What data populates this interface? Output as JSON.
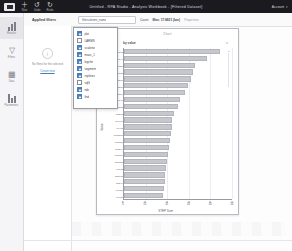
{
  "topbar": {
    "logo_icon": "app-logo-icon",
    "buttons": [
      {
        "icon": "plus-icon",
        "glyph": "＋",
        "label": "New"
      },
      {
        "icon": "undo-icon",
        "glyph": "↺",
        "label": "Undo"
      },
      {
        "icon": "redo-icon",
        "glyph": "↻",
        "label": "Redo"
      }
    ],
    "title": "Untitled - RPA Studio - Analysis Workbook - [Filtered Dataset]",
    "account_label": "Account",
    "chevron": "▾"
  },
  "rail": {
    "items": [
      {
        "label": "Results",
        "icon": "bar-chart-icon",
        "active": true
      },
      {
        "label": "Filters",
        "icon": "funnel-icon",
        "active": false
      },
      {
        "label": "Data",
        "icon": "table-icon",
        "active": false
      },
      {
        "label": "Parameters",
        "icon": "sliders-icon",
        "active": false
      }
    ]
  },
  "subbar": {
    "title": "Applied filters",
    "search_value": "filtercolumn_name",
    "chips": [
      {
        "text": "Count",
        "muted": false,
        "bold": false
      },
      {
        "text": "Max: 17.8821 (bar)",
        "muted": false,
        "bold": true
      },
      {
        "text": "Properties",
        "muted": true,
        "bold": false
      }
    ]
  },
  "filters_pane": {
    "circle_icon": "info-icon",
    "glyph": "i",
    "message": "No filters for the selected",
    "link": "Create new"
  },
  "dropdown": {
    "name": "column-multiselect-dropdown",
    "items": [
      {
        "label": "plot",
        "checked": true
      },
      {
        "label": "LARMS",
        "checked": false
      },
      {
        "label": "scaleno",
        "checked": true
      },
      {
        "label": "mass_1",
        "checked": true
      },
      {
        "label": "logchn",
        "checked": true
      },
      {
        "label": "segment",
        "checked": true
      },
      {
        "label": "replines",
        "checked": true
      },
      {
        "label": "vdjV",
        "checked": false
      },
      {
        "label": "nds",
        "checked": true
      },
      {
        "label": "find",
        "checked": true
      }
    ]
  },
  "panel": {
    "title": "Chart"
  },
  "chart_data": {
    "type": "bar",
    "orientation": "horizontal",
    "title": "by value",
    "corner_note": "n",
    "xlabel": "STEP Sum →",
    "ylabel": "Value",
    "xlim": [
      0,
      50
    ],
    "xticks": [
      0,
      10,
      20,
      30,
      40,
      50
    ],
    "xticklabels": [
      "0",
      "10",
      "20",
      "30",
      "40",
      "50"
    ],
    "grid": true,
    "legend": "none",
    "categories": [
      "aac012",
      "bbr144",
      "cclm20",
      "ddn033",
      "eeq571",
      "ffs208",
      "ggt119",
      "hhu640",
      "iiv382",
      "jjw275",
      "kkx901",
      "llz463",
      "mma118",
      "nnb750",
      "ooc294",
      "ppd806",
      "qqe537",
      "rrf082",
      "ssg613",
      "tth349",
      "uui927",
      "vvj450"
    ],
    "values": [
      44.6,
      38.2,
      33.1,
      31.8,
      30.9,
      29.6,
      28.2,
      26.0,
      24.8,
      23.1,
      22.4,
      22.0,
      21.6,
      21.2,
      20.8,
      20.4,
      20.0,
      19.6,
      19.2,
      18.8,
      18.3,
      17.9
    ]
  }
}
